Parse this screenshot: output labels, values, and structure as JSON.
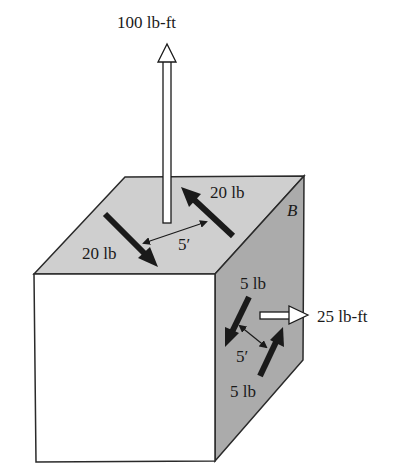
{
  "figure": {
    "colors": {
      "top_face": "#cfcfcf",
      "right_face": "#ababab",
      "front_face": "#ffffff",
      "edge": "#2a2a2a",
      "arrow": "#1a1a1a"
    },
    "labels": {
      "moment_top": "100 lb-ft",
      "moment_right": "25 lb-ft",
      "force_top_upper": "20 lb",
      "force_top_lower": "20 lb",
      "distance_top": "5′",
      "force_right_upper": "5 lb",
      "force_right_lower": "5 lb",
      "distance_right": "5′",
      "body_label": "B"
    }
  }
}
